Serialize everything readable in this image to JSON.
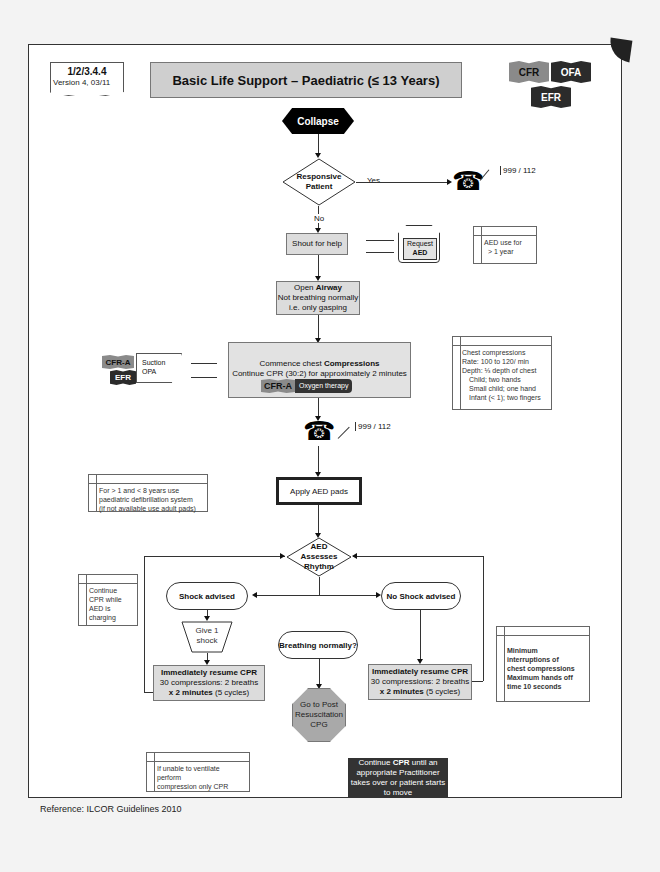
{
  "doc_tag": {
    "code": "1/2/3.4.4",
    "version": "Version 4, 03/11"
  },
  "title": "Basic Life Support – Paediatric  (≤ 13 Years)",
  "practitioner_flags": [
    "CFR",
    "OFA",
    "EFR"
  ],
  "nodes": {
    "collapse": "Collapse",
    "responsive": [
      "Responsive",
      "Patient"
    ],
    "yes_label": "Yes",
    "no_label": "No",
    "phone_number_1": "999 / 112",
    "shout": "Shout for help",
    "request_aed": [
      "Request",
      "AED"
    ],
    "aed_note": [
      "AED use for",
      "> 1 year"
    ],
    "open_airway": {
      "line1_pre": "Open ",
      "line1_bold": "Airway",
      "line2": "Not breathing normally",
      "line3": "i.e. only gasping"
    },
    "compressions": {
      "line1_pre": "Commence chest ",
      "line1_bold": "Compressions",
      "line2": "Continue CPR (30:2) for approximately 2 minutes",
      "oxygen_flag": "CFR-A",
      "oxygen_label": "Oxygen therapy"
    },
    "suction": {
      "flags": [
        "CFR-A",
        "EFR"
      ],
      "lines": [
        "Suction",
        "OPA"
      ]
    },
    "chest_note": [
      "Chest compressions",
      "Rate: 100 to 120/ min",
      "Depth: ⅓ depth of chest",
      "Child; two hands",
      "Small child; one hand",
      "Infant (< 1); two fingers"
    ],
    "phone_number_2": "999 / 112",
    "apply_pads": "Apply AED pads",
    "pads_note": [
      "For > 1 and < 8 years use",
      "paediatric defibrillation system",
      "(if not available use adult pads)"
    ],
    "aed_assesses": [
      "AED",
      "Assesses",
      "Rhythm"
    ],
    "charging_note": [
      "Continue",
      "CPR while",
      "AED is",
      "charging"
    ],
    "shock_advised": "Shock advised",
    "no_shock_advised": "No Shock advised",
    "give_shock": [
      "Give 1",
      "shock"
    ],
    "breathing_normally": "Breathing normally?",
    "resume_left": {
      "line1": "Immediately resume CPR",
      "line2": "30 compressions: 2 breaths",
      "line3_bold": "x 2 minutes",
      "line3_rest": " (5 cycles)"
    },
    "resume_right": {
      "line1": "Immediately resume CPR",
      "line2": "30 compressions: 2 breaths",
      "line3_bold": "x 2 minutes",
      "line3_rest": " (5 cycles)"
    },
    "post_resus": [
      "Go to Post",
      "Resuscitation",
      "CPG"
    ],
    "interruptions_note": [
      "Minimum",
      "interruptions of",
      "chest compressions",
      "Maximum hands off",
      "time 10 seconds"
    ],
    "ventilate_note": [
      "If unable to ventilate perform",
      "compression only CPR"
    ],
    "continue_cpr": {
      "pre": "Continue ",
      "bold": "CPR",
      "post": " until an",
      "line2": "appropriate Practitioner",
      "line3": "takes over or patient starts",
      "line4": "to move"
    }
  },
  "reference": "Reference: ILCOR Guidelines 2010"
}
